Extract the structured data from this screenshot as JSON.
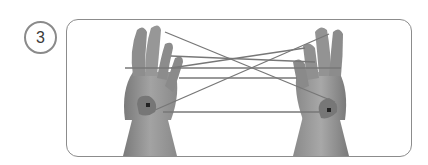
{
  "step": {
    "number": "3"
  },
  "illustration": {
    "subject": "two hands holding a string figure (cat's cradle) with crossed strings between them",
    "style": "grayscale photograph",
    "colors": {
      "skin_dark": "#6e6e6e",
      "skin_mid": "#8f8f8f",
      "skin_light": "#b4b4b4",
      "string": "#777777",
      "marker": "#222222",
      "border": "#8c8c8c",
      "badge_border": "#8a8a8a"
    }
  }
}
